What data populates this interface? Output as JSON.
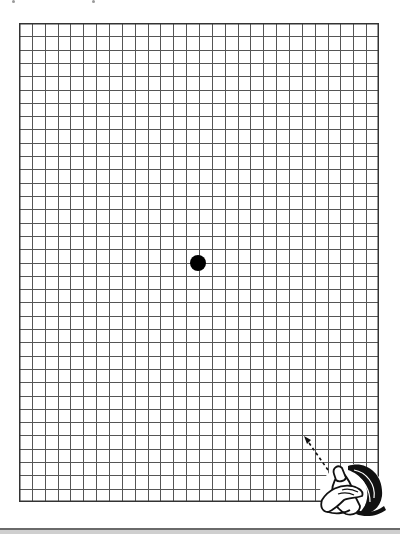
{
  "grid": {
    "columns": 28,
    "rows": 36,
    "left": 19,
    "top": 23,
    "width": 360,
    "height": 479,
    "line_color": "#555555",
    "border_color": "#333333",
    "background": "#ffffff"
  },
  "fixation_dot": {
    "cx": 198,
    "cy": 263,
    "radius": 8,
    "color": "#000000"
  },
  "illustration": {
    "description": "hand-covering-eye-icon",
    "arrow": "dashed arrow pointing up-left toward center"
  },
  "bottom_bar": {
    "color": "#cfcfcf",
    "border_color": "#6a6a6a"
  }
}
